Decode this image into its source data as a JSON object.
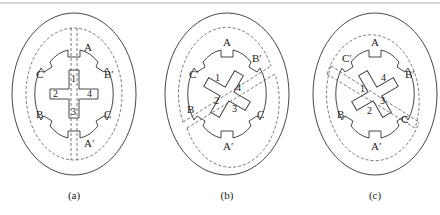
{
  "figure": {
    "panels": [
      {
        "id": "a",
        "caption": "(a)",
        "cx": 74,
        "rotor_angle": 0,
        "flux_angle": 90,
        "poles": {
          "top": "A",
          "bottom": "A′",
          "upper_right": "B′",
          "lower_right": "C",
          "upper_left": "C′",
          "lower_left": "B"
        },
        "rotor_teeth": [
          "1",
          "2",
          "3",
          "4"
        ]
      },
      {
        "id": "b",
        "caption": "(b)",
        "cx": 227,
        "rotor_angle": 30,
        "flux_angle": 30,
        "poles": {
          "top": "A",
          "bottom": "A′",
          "upper_right": "B′",
          "lower_right": "C",
          "upper_left": "C′",
          "lower_left": "B"
        },
        "rotor_teeth": [
          "1",
          "2",
          "3",
          "4"
        ]
      },
      {
        "id": "c",
        "caption": "(c)",
        "cx": 375,
        "rotor_angle": -30,
        "flux_angle": -30,
        "poles": {
          "top": "A",
          "bottom": "A′",
          "upper_right": "B′",
          "lower_right": "C",
          "upper_left": "C′",
          "lower_left": "B"
        },
        "rotor_teeth": [
          "1",
          "2",
          "3",
          "4"
        ]
      }
    ]
  },
  "labels": {
    "a": {
      "caption": "(a)",
      "A": "A",
      "Ap": "A′",
      "Bp": "B′",
      "C": "C",
      "Cp": "C′",
      "B": "B",
      "t1": "1",
      "t2": "2",
      "t3": "3",
      "t4": "4"
    },
    "b": {
      "caption": "(b)",
      "A": "A",
      "Ap": "A′",
      "Bp": "B′",
      "C": "C",
      "Cp": "C′",
      "B": "B",
      "t1": "1",
      "t2": "2",
      "t3": "3",
      "t4": "4"
    },
    "c": {
      "caption": "(c)",
      "A": "A",
      "Ap": "A′",
      "Bp": "B′",
      "C": "C",
      "Cp": "C′",
      "B": "B",
      "t1": "1",
      "t2": "2",
      "t3": "3",
      "t4": "4"
    }
  }
}
